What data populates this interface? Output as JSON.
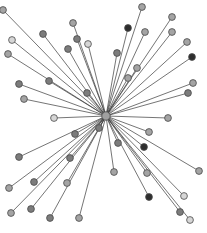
{
  "diagram": {
    "type": "star-network",
    "hub": {
      "id": "hub",
      "x": 106,
      "y": 116,
      "fill": "#a0a0a0"
    },
    "edge_color": "#3a3a3a",
    "node_radius": 3.4,
    "shade_palette": {
      "light": "#d6d6d6",
      "medium": "#a4a4a4",
      "dark": "#7c7c7c",
      "darkest": "#2e2e2e"
    },
    "nodes": [
      {
        "x": 3,
        "y": 10,
        "shade": "medium"
      },
      {
        "x": 73,
        "y": 23,
        "shade": "medium"
      },
      {
        "x": 43,
        "y": 34,
        "shade": "dark"
      },
      {
        "x": 12,
        "y": 40,
        "shade": "light"
      },
      {
        "x": 77,
        "y": 39,
        "shade": "dark"
      },
      {
        "x": 88,
        "y": 44,
        "shade": "light"
      },
      {
        "x": 68,
        "y": 49,
        "shade": "dark"
      },
      {
        "x": 8,
        "y": 54,
        "shade": "medium"
      },
      {
        "x": 49,
        "y": 81,
        "shade": "dark"
      },
      {
        "x": 19,
        "y": 84,
        "shade": "dark"
      },
      {
        "x": 24,
        "y": 99,
        "shade": "medium"
      },
      {
        "x": 87,
        "y": 93,
        "shade": "dark"
      },
      {
        "x": 142,
        "y": 7,
        "shade": "medium"
      },
      {
        "x": 128,
        "y": 28,
        "shade": "darkest"
      },
      {
        "x": 172,
        "y": 17,
        "shade": "medium"
      },
      {
        "x": 145,
        "y": 32,
        "shade": "medium"
      },
      {
        "x": 172,
        "y": 32,
        "shade": "medium"
      },
      {
        "x": 117,
        "y": 53,
        "shade": "dark"
      },
      {
        "x": 187,
        "y": 42,
        "shade": "medium"
      },
      {
        "x": 192,
        "y": 57,
        "shade": "darkest"
      },
      {
        "x": 137,
        "y": 68,
        "shade": "medium"
      },
      {
        "x": 128,
        "y": 78,
        "shade": "medium"
      },
      {
        "x": 193,
        "y": 83,
        "shade": "medium"
      },
      {
        "x": 188,
        "y": 93,
        "shade": "dark"
      },
      {
        "x": 54,
        "y": 118,
        "shade": "light"
      },
      {
        "x": 168,
        "y": 118,
        "shade": "medium"
      },
      {
        "x": 75,
        "y": 134,
        "shade": "dark"
      },
      {
        "x": 99,
        "y": 128,
        "shade": "dark"
      },
      {
        "x": 149,
        "y": 132,
        "shade": "medium"
      },
      {
        "x": 118,
        "y": 143,
        "shade": "dark"
      },
      {
        "x": 144,
        "y": 147,
        "shade": "darkest"
      },
      {
        "x": 19,
        "y": 157,
        "shade": "dark"
      },
      {
        "x": 70,
        "y": 158,
        "shade": "dark"
      },
      {
        "x": 114,
        "y": 172,
        "shade": "medium"
      },
      {
        "x": 147,
        "y": 173,
        "shade": "medium"
      },
      {
        "x": 199,
        "y": 171,
        "shade": "medium"
      },
      {
        "x": 34,
        "y": 182,
        "shade": "dark"
      },
      {
        "x": 67,
        "y": 183,
        "shade": "medium"
      },
      {
        "x": 9,
        "y": 188,
        "shade": "medium"
      },
      {
        "x": 149,
        "y": 197,
        "shade": "darkest"
      },
      {
        "x": 184,
        "y": 196,
        "shade": "light"
      },
      {
        "x": 11,
        "y": 213,
        "shade": "medium"
      },
      {
        "x": 31,
        "y": 209,
        "shade": "dark"
      },
      {
        "x": 50,
        "y": 218,
        "shade": "dark"
      },
      {
        "x": 79,
        "y": 218,
        "shade": "medium"
      },
      {
        "x": 180,
        "y": 212,
        "shade": "dark"
      },
      {
        "x": 190,
        "y": 220,
        "shade": "light"
      }
    ]
  }
}
